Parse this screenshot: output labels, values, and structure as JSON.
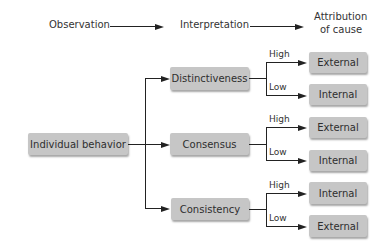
{
  "header": {
    "observation": "Observation",
    "interpretation": "Interpretation",
    "attribution_line1": "Attribution",
    "attribution_line2": "of cause"
  },
  "root": {
    "label": "Individual behavior"
  },
  "branches": [
    {
      "label": "Distinctiveness",
      "outcomes": [
        {
          "level": "High",
          "label": "External"
        },
        {
          "level": "Low",
          "label": "Internal"
        }
      ]
    },
    {
      "label": "Consensus",
      "outcomes": [
        {
          "level": "High",
          "label": "External"
        },
        {
          "level": "Low",
          "label": "Internal"
        }
      ]
    },
    {
      "label": "Consistency",
      "outcomes": [
        {
          "level": "High",
          "label": "Internal"
        },
        {
          "level": "Low",
          "label": "External"
        }
      ]
    }
  ],
  "colors": {
    "box_fill": "#c6c6c6",
    "line": "#222222",
    "background": "#ffffff"
  }
}
